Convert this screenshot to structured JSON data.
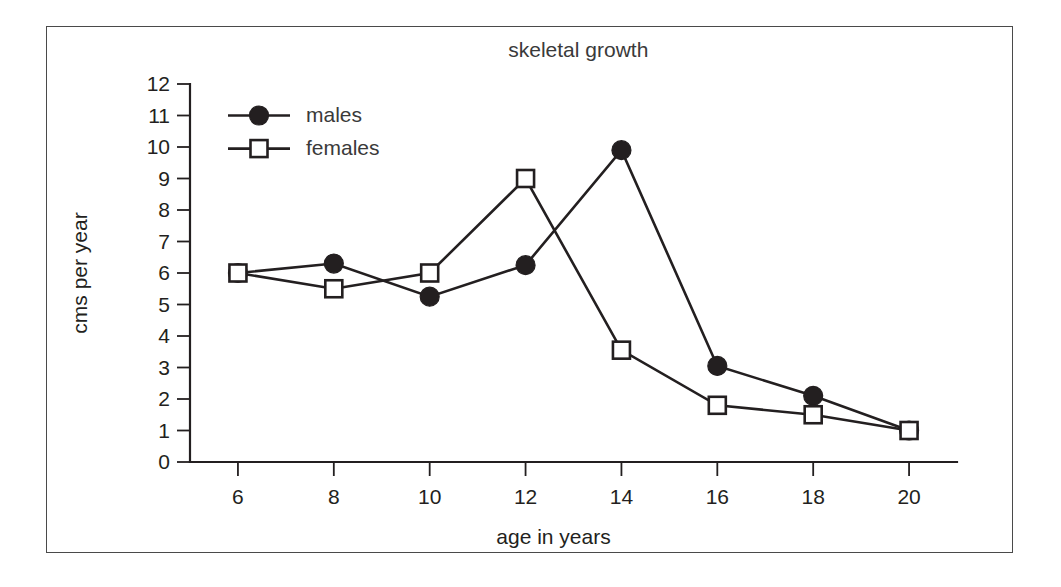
{
  "figure": {
    "frame_border_color": "#4a4a4a",
    "background_color": "#ffffff",
    "ink_color": "#231f20"
  },
  "chart_data": {
    "type": "line",
    "title": "skeletal growth",
    "xlabel": "age in years",
    "ylabel": "cms per year",
    "x": [
      6,
      8,
      10,
      12,
      14,
      16,
      18,
      20
    ],
    "xticklabels": [
      "6",
      "8",
      "10",
      "12",
      "14",
      "16",
      "18",
      "20"
    ],
    "yticklabels": [
      "0",
      "1",
      "2",
      "3",
      "4",
      "5",
      "6",
      "7",
      "8",
      "9",
      "10",
      "11",
      "12"
    ],
    "yticks": [
      0,
      1,
      2,
      3,
      4,
      5,
      6,
      7,
      8,
      9,
      10,
      11,
      12
    ],
    "xlim": [
      5,
      21
    ],
    "ylim": [
      0,
      12
    ],
    "grid": false,
    "legend_position": "upper left",
    "series": [
      {
        "name": "males",
        "marker": "filled-circle",
        "color": "#231f20",
        "values": [
          6.0,
          6.3,
          5.25,
          6.25,
          9.9,
          3.05,
          2.1,
          1.0
        ]
      },
      {
        "name": "females",
        "marker": "open-square",
        "color": "#231f20",
        "values": [
          6.0,
          5.5,
          6.0,
          9.0,
          3.55,
          1.8,
          1.5,
          1.0
        ]
      }
    ]
  }
}
